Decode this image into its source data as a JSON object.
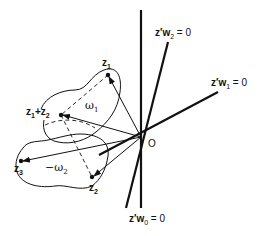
{
  "diagram": {
    "type": "geometric vector diagram",
    "origin_label": "O",
    "points": [
      {
        "id": "z1",
        "name": "z",
        "sub": "1"
      },
      {
        "id": "z2",
        "name": "z",
        "sub": "2"
      },
      {
        "id": "z3",
        "name": "z",
        "sub": "3"
      },
      {
        "id": "z1pz2",
        "name1": "z",
        "sub1": "1",
        "plus": "+",
        "name2": "z",
        "sub2": "2"
      }
    ],
    "regions": [
      {
        "id": "omega1",
        "symbol": "ω",
        "sub": "1"
      },
      {
        "id": "omega2",
        "prefix": "−",
        "symbol": "ω",
        "sub": "2"
      }
    ],
    "hyperplanes": [
      {
        "id": "w0",
        "prefix": "z′w",
        "sub": "0",
        "suffix": " = 0"
      },
      {
        "id": "w1",
        "prefix": "z′w",
        "sub": "1",
        "suffix": " = 0"
      },
      {
        "id": "w2",
        "prefix": "z′w",
        "sub": "2",
        "suffix": " = 0"
      }
    ],
    "colors": {
      "ink": "#111111",
      "background": "#ffffff"
    }
  }
}
